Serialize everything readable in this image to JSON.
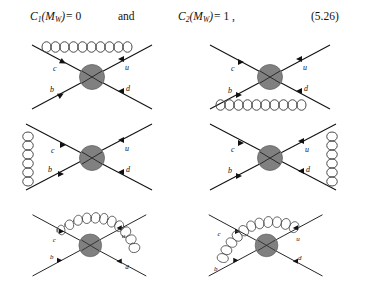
{
  "equation": {
    "lhs_symbol": "C",
    "lhs_sub": "1",
    "lhs_arg": "(M",
    "lhs_arg_sub": "W",
    "lhs_arg_close": ")",
    "lhs_equals": "= 0",
    "conjunction": "and",
    "rhs_symbol": "C",
    "rhs_sub": "2",
    "rhs_arg": "(M",
    "rhs_arg_sub": "W",
    "rhs_arg_close": ")",
    "rhs_equals": "= 1 ,",
    "number": "(5.26)"
  },
  "colors": {
    "blob_fill": "#808080",
    "blob_stroke": "#5a5a5a",
    "fermion": "#111111",
    "gluon": "#4a4a4a",
    "background": "#ffffff"
  },
  "diagrams": [
    {
      "id": "diagram-1",
      "position": "row1-left",
      "gluon_description": "horizontal gluon across the two upper legs above the vertex",
      "gluon_placement": "top",
      "labels": {
        "upper_left": "c",
        "upper_right": "u",
        "lower_left": "b",
        "lower_right": "d"
      }
    },
    {
      "id": "diagram-2",
      "position": "row1-right",
      "gluon_description": "horizontal gluon across the two lower legs below the vertex",
      "gluon_placement": "bottom",
      "labels": {
        "upper_left": "c",
        "upper_right": "u",
        "lower_left": "b",
        "lower_right": "d"
      }
    },
    {
      "id": "diagram-3",
      "position": "row2-left",
      "gluon_description": "vertical gluon on the left joining the c and b legs",
      "gluon_placement": "left",
      "labels": {
        "upper_left": "c",
        "upper_right": "u",
        "lower_left": "b",
        "lower_right": "d"
      }
    },
    {
      "id": "diagram-4",
      "position": "row2-right",
      "gluon_description": "vertical gluon on the right joining the u and d legs",
      "gluon_placement": "right",
      "labels": {
        "upper_left": "c",
        "upper_right": "u",
        "lower_left": "b",
        "lower_right": "d"
      }
    },
    {
      "id": "diagram-5",
      "position": "row3-left",
      "gluon_description": "gluon arc from the c leg over the top and down the right side to the d leg",
      "gluon_placement": "arc-c-to-d",
      "labels": {
        "upper_left": "c",
        "upper_right": "u",
        "lower_left": "b",
        "lower_right": "d"
      }
    },
    {
      "id": "diagram-6",
      "position": "row3-right",
      "gluon_description": "gluon arc from the b leg up the left side and over the top to the u leg",
      "gluon_placement": "arc-b-to-u",
      "labels": {
        "upper_left": "c",
        "upper_right": "u",
        "lower_left": "b",
        "lower_right": "d"
      }
    }
  ]
}
